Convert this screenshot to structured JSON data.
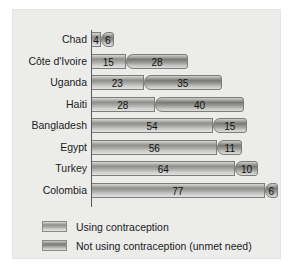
{
  "chart_data": {
    "type": "bar",
    "orientation": "horizontal",
    "stacked": true,
    "title": "",
    "xlabel": "",
    "ylabel": "",
    "grid": false,
    "legend_position": "bottom-left",
    "xlim": [
      0,
      83
    ],
    "categories": [
      "Chad",
      "Côte d'Ivoire",
      "Uganda",
      "Haiti",
      "Bangladesh",
      "Egypt",
      "Turkey",
      "Colombia"
    ],
    "series": [
      {
        "name": "Using contraception",
        "values": [
          4,
          15,
          23,
          28,
          54,
          56,
          64,
          77
        ]
      },
      {
        "name": "Not using contraception (unmet need)",
        "values": [
          6,
          28,
          35,
          40,
          15,
          11,
          10,
          6
        ]
      }
    ],
    "totals": [
      10,
      43,
      58,
      68,
      69,
      67,
      74,
      83
    ]
  },
  "legend": {
    "items": [
      {
        "label": "Using contraception",
        "swatch": "light-gradient-bar"
      },
      {
        "label": "Not using contraception (unmet need)",
        "swatch": "dark-gradient-bar"
      }
    ]
  },
  "colors": {
    "panel_background": "#ececeb",
    "page_background": "#ffffff",
    "axis": "#5a5a5a",
    "series1_mid": "#8e8e8b",
    "series2_mid": "#797976",
    "text": "#1b1b1b"
  }
}
